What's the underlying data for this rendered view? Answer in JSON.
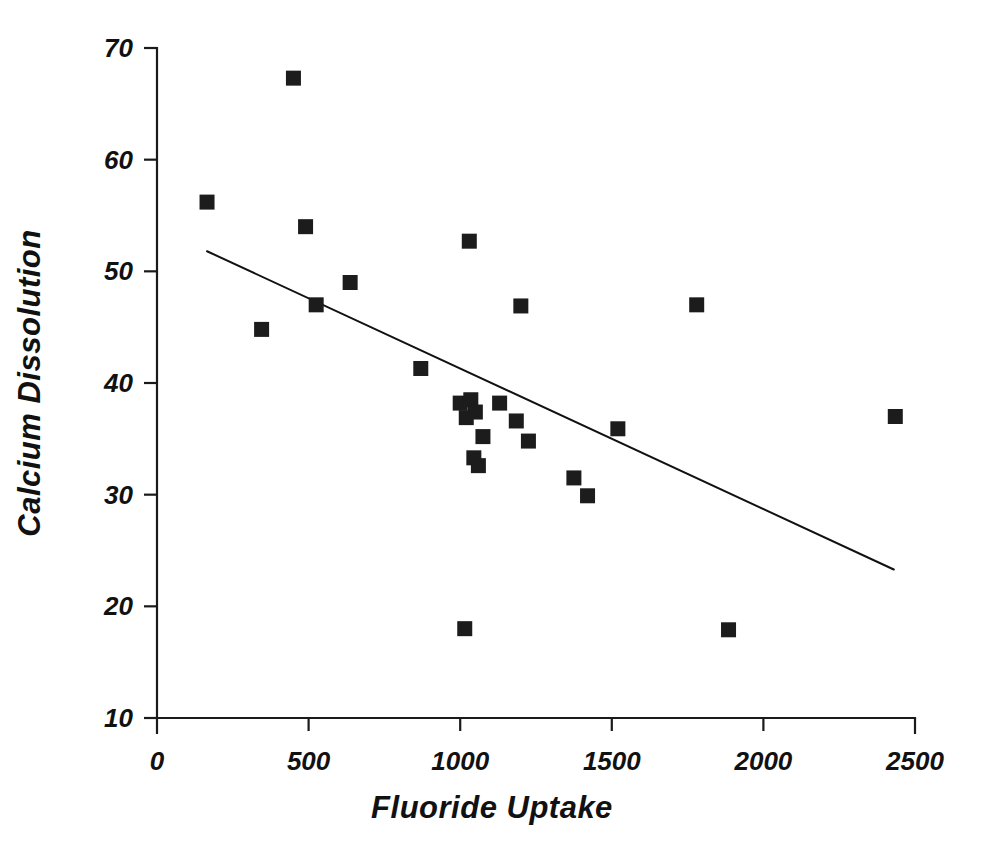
{
  "chart_data": {
    "type": "scatter",
    "title": "",
    "subtitle": "",
    "xlabel": "Fluoride Uptake",
    "ylabel": "Calcium Dissolution",
    "xlim": [
      0,
      2500
    ],
    "ylim": [
      10,
      70
    ],
    "xticks": [
      0,
      500,
      1000,
      1500,
      2000,
      2500
    ],
    "yticks": [
      10,
      20,
      30,
      40,
      50,
      60,
      70
    ],
    "xtick_labels": [
      "0",
      "500",
      "1000",
      "1500",
      "2000",
      "2500"
    ],
    "ytick_labels": [
      "10",
      "20",
      "30",
      "40",
      "50",
      "60",
      "70"
    ],
    "grid": false,
    "legend": false,
    "legend_position": "none",
    "marker": "square",
    "marker_color": "#1c1c1c",
    "marker_size": 15,
    "series": [
      {
        "name": "samples",
        "x": [
          165,
          345,
          450,
          490,
          525,
          637,
          870,
          1000,
          1015,
          1020,
          1030,
          1035,
          1045,
          1050,
          1060,
          1075,
          1130,
          1185,
          1200,
          1225,
          1375,
          1420,
          1520,
          1780,
          1885,
          2435
        ],
        "y": [
          56.2,
          44.8,
          67.3,
          54.0,
          47.0,
          49.0,
          41.3,
          38.2,
          18.0,
          36.9,
          52.7,
          38.5,
          33.3,
          37.4,
          32.6,
          35.2,
          38.2,
          36.6,
          46.9,
          34.8,
          31.5,
          29.9,
          35.9,
          47.0,
          17.9,
          37.0
        ]
      }
    ],
    "trend_line": {
      "type": "linear-fit",
      "x_start": 165,
      "y_start": 51.8,
      "x_end": 2430,
      "y_end": 23.3
    }
  },
  "axes": {
    "x_title": "Fluoride Uptake",
    "y_title": "Calcium Dissolution"
  },
  "colors": {
    "ink": "#111111",
    "marker": "#1c1c1c",
    "background": "#ffffff"
  }
}
